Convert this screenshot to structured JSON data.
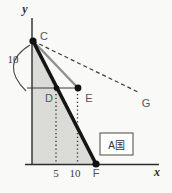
{
  "figure": {
    "axis_labels": {
      "y": "y",
      "x": "x"
    },
    "point_labels": {
      "c": "C",
      "d": "D",
      "e": "E",
      "f": "F",
      "g": "G"
    },
    "tick_labels": {
      "five": "5",
      "ten": "10"
    },
    "brace_label": "10",
    "region_box_label": "A国",
    "colors": {
      "background": "#f9f9f7",
      "shade_fill": "#dbdbd8",
      "thick_line": "#151515",
      "gray_line": "#8f8f8f",
      "dashed_line": "#3c3c3c",
      "dotted_line": "#2f2f2f",
      "axis": "#2d2d2d",
      "box_border": "#5a5a5a"
    }
  }
}
